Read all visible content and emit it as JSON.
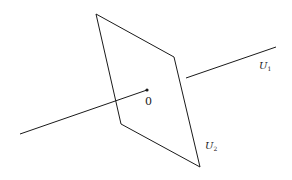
{
  "diagram": {
    "colors": {
      "stroke": "#1a1a1a",
      "background": "#ffffff"
    },
    "plane": {
      "name": "U2",
      "vertices": [
        [
          96,
          14
        ],
        [
          174,
          57
        ],
        [
          200,
          167
        ],
        [
          121,
          124
        ]
      ]
    },
    "line": {
      "name": "U1",
      "segment_left": {
        "from": [
          20,
          134
        ],
        "to": [
          147,
          90
        ]
      },
      "segment_right": {
        "from": [
          186,
          78
        ],
        "to": [
          276,
          47
        ]
      }
    },
    "origin": {
      "position": [
        147,
        90
      ]
    },
    "labels": {
      "origin": "0",
      "u1_main": "U",
      "u1_sub": "1",
      "u2_main": "U",
      "u2_sub": "2"
    }
  }
}
